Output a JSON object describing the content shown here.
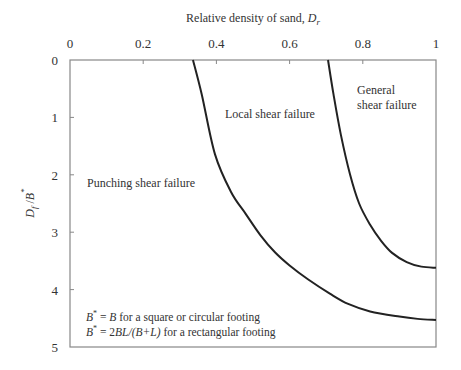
{
  "chart_data": {
    "type": "line",
    "title": "",
    "xlabel": "Relative density of sand, D_r",
    "xlabel_parts": {
      "main": "Relative density of sand, ",
      "var": "D",
      "sub": "r"
    },
    "ylabel": "D_f/B*",
    "ylabel_parts": {
      "var1": "D",
      "sub1": "f",
      "slash": " /",
      "var2": "B",
      "sup2": "*"
    },
    "x_axis_position": "top",
    "y_axis_inverted": true,
    "xlim": [
      0,
      1
    ],
    "ylim": [
      0,
      5
    ],
    "x_ticks": [
      0,
      0.2,
      0.4,
      0.6,
      0.8,
      1
    ],
    "x_tick_labels": [
      "0",
      "0.2",
      "0.4",
      "0.6",
      "0.8",
      "1"
    ],
    "y_ticks": [
      0,
      1,
      2,
      3,
      4,
      5
    ],
    "y_tick_labels": [
      "0",
      "1",
      "2",
      "3",
      "4",
      "5"
    ],
    "grid": false,
    "legend": "none",
    "series": [
      {
        "name": "Punching / local shear boundary",
        "points": [
          [
            0.336,
            0
          ],
          [
            0.36,
            0.6
          ],
          [
            0.396,
            1.64
          ],
          [
            0.44,
            2.3
          ],
          [
            0.48,
            2.68
          ],
          [
            0.52,
            3.05
          ],
          [
            0.56,
            3.35
          ],
          [
            0.6,
            3.58
          ],
          [
            0.65,
            3.82
          ],
          [
            0.71,
            4.07
          ],
          [
            0.76,
            4.25
          ],
          [
            0.82,
            4.38
          ],
          [
            0.9,
            4.47
          ],
          [
            0.95,
            4.51
          ],
          [
            1.0,
            4.53
          ]
        ]
      },
      {
        "name": "Local / general shear boundary",
        "points": [
          [
            0.705,
            0
          ],
          [
            0.72,
            0.6
          ],
          [
            0.74,
            1.3
          ],
          [
            0.765,
            1.99
          ],
          [
            0.79,
            2.5
          ],
          [
            0.82,
            2.87
          ],
          [
            0.85,
            3.15
          ],
          [
            0.88,
            3.36
          ],
          [
            0.92,
            3.52
          ],
          [
            0.96,
            3.6
          ],
          [
            1.0,
            3.62
          ]
        ]
      }
    ],
    "annotations": [
      {
        "id": "punching",
        "lines": [
          "Punching shear failure"
        ],
        "x": 0.045,
        "y": 2.2
      },
      {
        "id": "local",
        "lines": [
          "Local shear failure"
        ],
        "x": 0.425,
        "y": 1.0
      },
      {
        "id": "general",
        "lines": [
          "General",
          "shear failure"
        ],
        "x": 0.785,
        "y": [
          0.52,
          0.8
        ]
      }
    ],
    "notes": [
      {
        "lhs_var": "B",
        "lhs_sup": "*",
        "rhs": " = ",
        "rhs_var": "B",
        "rest": " for a square or circular footing"
      },
      {
        "lhs_var": "B",
        "lhs_sup": "*",
        "rhs": " = 2",
        "rhs_var": "BL/(B+L)",
        "rest": " for a rectangular footing"
      }
    ]
  },
  "colors": {
    "curve": "#222222",
    "frame": "#888888",
    "text": "#333333"
  }
}
